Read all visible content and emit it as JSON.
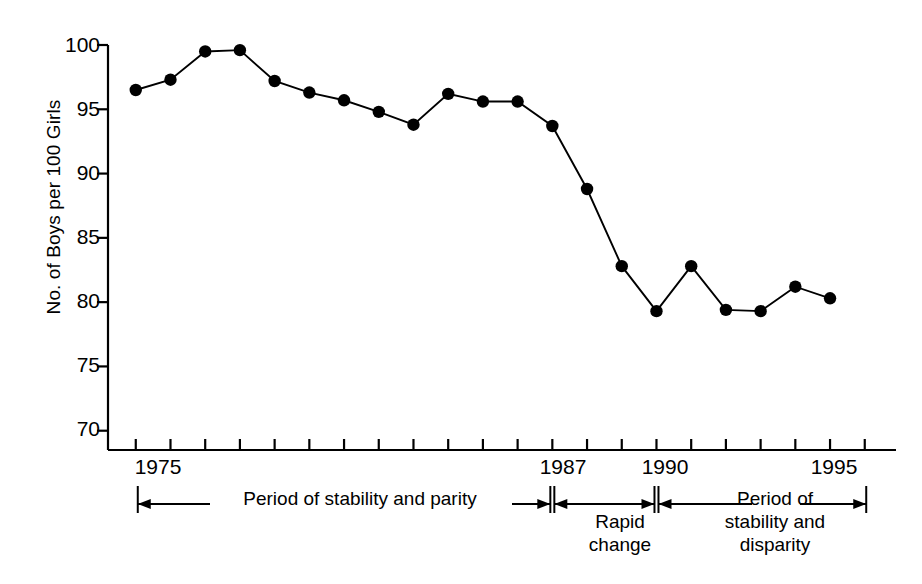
{
  "chart_data": {
    "type": "line",
    "title": "",
    "xlabel": "",
    "ylabel": "No. of Boys per 100 Girls",
    "ylim": [
      68.5,
      100
    ],
    "xlim": [
      1974.2,
      1996.9
    ],
    "grid": false,
    "legend": "none",
    "y_ticks": [
      70,
      75,
      80,
      85,
      90,
      95,
      100
    ],
    "y_tick_labels": [
      "70",
      "75",
      "80",
      "85",
      "90",
      "95",
      "100"
    ],
    "x_tick_labels": [
      {
        "year": 1975,
        "label": "1975"
      },
      {
        "year": 1987,
        "label": "1987"
      },
      {
        "year": 1990,
        "label": "1990"
      },
      {
        "year": 1995,
        "label": "1995"
      }
    ],
    "x_minor_ticks": [
      1975,
      1976,
      1977,
      1978,
      1979,
      1980,
      1981,
      1982,
      1983,
      1984,
      1985,
      1986,
      1987,
      1988,
      1989,
      1990,
      1991,
      1992,
      1993,
      1994,
      1995,
      1996
    ],
    "x": [
      1975,
      1976,
      1977,
      1978,
      1979,
      1980,
      1981,
      1982,
      1983,
      1984,
      1985,
      1986,
      1987,
      1988,
      1989,
      1990,
      1991,
      1992,
      1993,
      1994,
      1995
    ],
    "values": [
      96.5,
      97.3,
      99.5,
      99.6,
      97.2,
      96.3,
      95.7,
      94.8,
      93.8,
      96.2,
      95.6,
      95.6,
      93.7,
      88.8,
      82.8,
      79.3,
      82.8,
      79.4,
      79.3,
      81.2,
      80.3
    ],
    "marker": "filled-circle",
    "line_color": "#000000",
    "marker_color": "#000000",
    "annotations": [
      {
        "id": "period-stability-parity",
        "text": "Period of stability and parity",
        "from_year": 1975,
        "to_year": 1987
      },
      {
        "id": "rapid-change",
        "text": "Rapid change",
        "from_year": 1987,
        "to_year": 1990
      },
      {
        "id": "period-stability-disparity",
        "text": "Period of stability and disparity",
        "from_year": 1990,
        "to_year": 1996.1
      }
    ]
  },
  "axis": {
    "y_label": "No. of Boys per 100 Girls",
    "y_ticks": [
      "100",
      "95",
      "90",
      "85",
      "80",
      "75",
      "70"
    ],
    "x_labels": [
      "1975",
      "1987",
      "1990",
      "1995"
    ]
  },
  "annotations": {
    "left_text": "Period of stability and parity",
    "middle_line1": "Rapid",
    "middle_line2": "change",
    "right_line1": "Period of",
    "right_line2": "stability and",
    "right_line3": "disparity"
  }
}
